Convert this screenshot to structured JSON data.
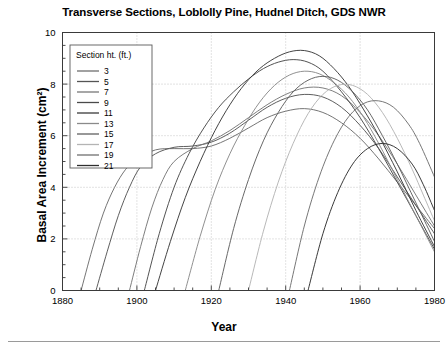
{
  "chart_data": {
    "type": "line",
    "title": "Transverse Sections, Loblolly Pine, Hudnel Ditch, GDS NWR",
    "xlabel": "Year",
    "ylabel": "Basal Area Increment (cm²)",
    "xlim": [
      1880,
      1980
    ],
    "ylim": [
      0,
      10
    ],
    "xticks": [
      1880,
      1900,
      1920,
      1940,
      1960,
      1980
    ],
    "xtick_labels": [
      "1880",
      "1900",
      "1920",
      "1940",
      "1960",
      "1980"
    ],
    "x_minor_tick_step": 5,
    "yticks": [
      0,
      2,
      4,
      6,
      8,
      10
    ],
    "ytick_labels": [
      "0",
      "2",
      "4",
      "6",
      "8",
      "10"
    ],
    "y_minor_tick_step": 0.5,
    "grid": "dotted gridlines at major x and y ticks",
    "legend_position": "upper-left inside axes",
    "legend_title": "Section ht. (ft.)",
    "series": [
      {
        "name": "3",
        "color": "#6e6e6e",
        "points": [
          [
            1885,
            0.0
          ],
          [
            1888,
            1.6
          ],
          [
            1891,
            3.0
          ],
          [
            1894,
            4.0
          ],
          [
            1897,
            4.7
          ],
          [
            1900,
            5.1
          ],
          [
            1905,
            5.45
          ],
          [
            1910,
            5.5
          ],
          [
            1915,
            5.5
          ],
          [
            1920,
            5.6
          ],
          [
            1925,
            5.9
          ],
          [
            1930,
            6.3
          ],
          [
            1935,
            6.7
          ],
          [
            1940,
            6.95
          ],
          [
            1945,
            7.05
          ],
          [
            1950,
            6.9
          ],
          [
            1955,
            6.5
          ],
          [
            1960,
            5.9
          ],
          [
            1965,
            5.1
          ],
          [
            1970,
            4.2
          ],
          [
            1975,
            3.3
          ],
          [
            1980,
            2.4
          ]
        ]
      },
      {
        "name": "5",
        "color": "#555555",
        "points": [
          [
            1889,
            0.0
          ],
          [
            1892,
            1.5
          ],
          [
            1895,
            2.9
          ],
          [
            1898,
            4.0
          ],
          [
            1901,
            4.8
          ],
          [
            1905,
            5.3
          ],
          [
            1910,
            5.55
          ],
          [
            1915,
            5.6
          ],
          [
            1920,
            5.75
          ],
          [
            1925,
            6.1
          ],
          [
            1930,
            6.6
          ],
          [
            1935,
            7.1
          ],
          [
            1940,
            7.45
          ],
          [
            1945,
            7.6
          ],
          [
            1950,
            7.5
          ],
          [
            1955,
            7.1
          ],
          [
            1960,
            6.4
          ],
          [
            1965,
            5.5
          ],
          [
            1970,
            4.4
          ],
          [
            1975,
            3.3
          ],
          [
            1980,
            2.2
          ]
        ]
      },
      {
        "name": "7",
        "color": "#777777",
        "points": [
          [
            1898,
            0.0
          ],
          [
            1901,
            1.7
          ],
          [
            1904,
            3.2
          ],
          [
            1907,
            4.3
          ],
          [
            1910,
            5.0
          ],
          [
            1915,
            5.5
          ],
          [
            1920,
            5.8
          ],
          [
            1925,
            6.2
          ],
          [
            1930,
            6.7
          ],
          [
            1935,
            7.2
          ],
          [
            1940,
            7.6
          ],
          [
            1945,
            7.85
          ],
          [
            1950,
            7.85
          ],
          [
            1955,
            7.55
          ],
          [
            1960,
            6.9
          ],
          [
            1965,
            6.0
          ],
          [
            1970,
            4.9
          ],
          [
            1975,
            3.7
          ],
          [
            1980,
            2.5
          ]
        ]
      },
      {
        "name": "9",
        "color": "#4a4a4a",
        "points": [
          [
            1902,
            0.0
          ],
          [
            1906,
            2.2
          ],
          [
            1910,
            4.0
          ],
          [
            1914,
            5.3
          ],
          [
            1918,
            6.3
          ],
          [
            1922,
            7.1
          ],
          [
            1926,
            7.7
          ],
          [
            1930,
            8.2
          ],
          [
            1934,
            8.6
          ],
          [
            1938,
            8.85
          ],
          [
            1942,
            8.95
          ],
          [
            1946,
            8.85
          ],
          [
            1950,
            8.5
          ],
          [
            1955,
            7.7
          ],
          [
            1960,
            6.7
          ],
          [
            1965,
            5.5
          ],
          [
            1970,
            4.2
          ],
          [
            1975,
            2.9
          ],
          [
            1980,
            1.6
          ]
        ]
      },
      {
        "name": "11",
        "color": "#3a3a3a",
        "points": [
          [
            1905,
            0.0
          ],
          [
            1909,
            1.9
          ],
          [
            1913,
            3.6
          ],
          [
            1917,
            5.0
          ],
          [
            1921,
            6.2
          ],
          [
            1925,
            7.2
          ],
          [
            1929,
            8.0
          ],
          [
            1933,
            8.6
          ],
          [
            1937,
            9.0
          ],
          [
            1941,
            9.25
          ],
          [
            1945,
            9.3
          ],
          [
            1949,
            9.1
          ],
          [
            1953,
            8.6
          ],
          [
            1957,
            7.9
          ],
          [
            1961,
            7.0
          ],
          [
            1965,
            6.0
          ],
          [
            1970,
            4.6
          ],
          [
            1975,
            3.1
          ],
          [
            1980,
            1.7
          ]
        ]
      },
      {
        "name": "13",
        "color": "#8a8a8a",
        "points": [
          [
            1913,
            0.0
          ],
          [
            1917,
            2.1
          ],
          [
            1921,
            3.9
          ],
          [
            1925,
            5.3
          ],
          [
            1929,
            6.4
          ],
          [
            1933,
            7.3
          ],
          [
            1937,
            7.95
          ],
          [
            1941,
            8.35
          ],
          [
            1945,
            8.5
          ],
          [
            1949,
            8.4
          ],
          [
            1953,
            8.05
          ],
          [
            1957,
            7.5
          ],
          [
            1961,
            6.7
          ],
          [
            1965,
            5.7
          ],
          [
            1970,
            4.3
          ],
          [
            1975,
            2.9
          ],
          [
            1980,
            1.5
          ]
        ]
      },
      {
        "name": "15",
        "color": "#606060",
        "points": [
          [
            1922,
            0.0
          ],
          [
            1926,
            2.4
          ],
          [
            1930,
            4.3
          ],
          [
            1934,
            5.8
          ],
          [
            1938,
            6.9
          ],
          [
            1942,
            7.7
          ],
          [
            1946,
            8.15
          ],
          [
            1950,
            8.3
          ],
          [
            1954,
            8.15
          ],
          [
            1958,
            7.7
          ],
          [
            1962,
            7.0
          ],
          [
            1966,
            6.0
          ],
          [
            1970,
            4.9
          ],
          [
            1975,
            3.4
          ],
          [
            1980,
            1.9
          ]
        ]
      },
      {
        "name": "17",
        "color": "#b4b4b4",
        "points": [
          [
            1930,
            0.0
          ],
          [
            1934,
            2.3
          ],
          [
            1938,
            4.2
          ],
          [
            1942,
            5.7
          ],
          [
            1946,
            6.85
          ],
          [
            1950,
            7.6
          ],
          [
            1954,
            7.95
          ],
          [
            1958,
            7.95
          ],
          [
            1962,
            7.6
          ],
          [
            1966,
            6.9
          ],
          [
            1970,
            5.9
          ],
          [
            1974,
            4.7
          ],
          [
            1977,
            3.7
          ],
          [
            1980,
            2.7
          ]
        ]
      },
      {
        "name": "19",
        "color": "#707070",
        "points": [
          [
            1941,
            0.0
          ],
          [
            1945,
            2.5
          ],
          [
            1949,
            4.4
          ],
          [
            1953,
            5.8
          ],
          [
            1957,
            6.75
          ],
          [
            1961,
            7.25
          ],
          [
            1965,
            7.35
          ],
          [
            1969,
            7.1
          ],
          [
            1973,
            6.45
          ],
          [
            1976,
            5.7
          ],
          [
            1980,
            4.4
          ]
        ]
      },
      {
        "name": "21",
        "color": "#2e2e2e",
        "points": [
          [
            1946,
            0.0
          ],
          [
            1950,
            2.2
          ],
          [
            1954,
            3.8
          ],
          [
            1958,
            4.9
          ],
          [
            1962,
            5.5
          ],
          [
            1966,
            5.7
          ],
          [
            1970,
            5.5
          ],
          [
            1974,
            4.9
          ],
          [
            1977,
            4.1
          ],
          [
            1980,
            3.1
          ]
        ]
      }
    ]
  },
  "figure": {
    "title": "Transverse Sections, Loblolly Pine, Hudnel Ditch, GDS NWR",
    "xlabel": "Year",
    "ylabel": "Basal Area Increment (cm²)",
    "legend_title": "Section ht. (ft.)"
  }
}
